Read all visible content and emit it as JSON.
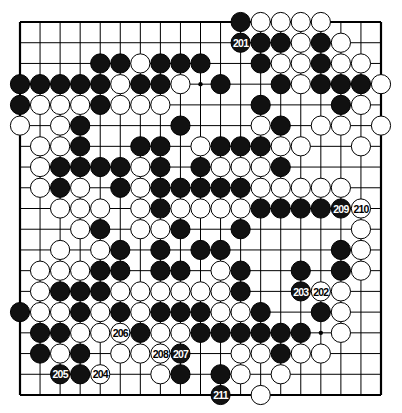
{
  "diagram": {
    "type": "go-board",
    "size": 19,
    "colors": {
      "black": "#111111",
      "white": "#ffffff",
      "line": "#000000"
    },
    "star_points": [
      [
        3,
        9
      ],
      [
        15,
        15
      ]
    ],
    "stones": [
      {
        "r": 0,
        "c": 11,
        "color": "B"
      },
      {
        "r": 0,
        "c": 12,
        "color": "W"
      },
      {
        "r": 0,
        "c": 13,
        "color": "W"
      },
      {
        "r": 0,
        "c": 14,
        "color": "W"
      },
      {
        "r": 0,
        "c": 15,
        "color": "W"
      },
      {
        "r": 1,
        "c": 11,
        "color": "B",
        "label": "201"
      },
      {
        "r": 1,
        "c": 12,
        "color": "B"
      },
      {
        "r": 1,
        "c": 13,
        "color": "B"
      },
      {
        "r": 1,
        "c": 14,
        "color": "W"
      },
      {
        "r": 1,
        "c": 15,
        "color": "B"
      },
      {
        "r": 1,
        "c": 16,
        "color": "W"
      },
      {
        "r": 2,
        "c": 4,
        "color": "B"
      },
      {
        "r": 2,
        "c": 5,
        "color": "B"
      },
      {
        "r": 2,
        "c": 6,
        "color": "W"
      },
      {
        "r": 2,
        "c": 7,
        "color": "B"
      },
      {
        "r": 2,
        "c": 8,
        "color": "B"
      },
      {
        "r": 2,
        "c": 9,
        "color": "B"
      },
      {
        "r": 2,
        "c": 12,
        "color": "B"
      },
      {
        "r": 2,
        "c": 13,
        "color": "W"
      },
      {
        "r": 2,
        "c": 14,
        "color": "W"
      },
      {
        "r": 2,
        "c": 15,
        "color": "B"
      },
      {
        "r": 2,
        "c": 16,
        "color": "W"
      },
      {
        "r": 2,
        "c": 17,
        "color": "W"
      },
      {
        "r": 3,
        "c": 0,
        "color": "B"
      },
      {
        "r": 3,
        "c": 1,
        "color": "B"
      },
      {
        "r": 3,
        "c": 2,
        "color": "B"
      },
      {
        "r": 3,
        "c": 3,
        "color": "B"
      },
      {
        "r": 3,
        "c": 4,
        "color": "B"
      },
      {
        "r": 3,
        "c": 5,
        "color": "W"
      },
      {
        "r": 3,
        "c": 6,
        "color": "B"
      },
      {
        "r": 3,
        "c": 7,
        "color": "B"
      },
      {
        "r": 3,
        "c": 8,
        "color": "W"
      },
      {
        "r": 3,
        "c": 10,
        "color": "B"
      },
      {
        "r": 3,
        "c": 13,
        "color": "B"
      },
      {
        "r": 3,
        "c": 14,
        "color": "W"
      },
      {
        "r": 3,
        "c": 15,
        "color": "B"
      },
      {
        "r": 3,
        "c": 16,
        "color": "B"
      },
      {
        "r": 3,
        "c": 17,
        "color": "B"
      },
      {
        "r": 3,
        "c": 18,
        "color": "W"
      },
      {
        "r": 4,
        "c": 0,
        "color": "B"
      },
      {
        "r": 4,
        "c": 1,
        "color": "W"
      },
      {
        "r": 4,
        "c": 2,
        "color": "W"
      },
      {
        "r": 4,
        "c": 3,
        "color": "W"
      },
      {
        "r": 4,
        "c": 4,
        "color": "B"
      },
      {
        "r": 4,
        "c": 5,
        "color": "W"
      },
      {
        "r": 4,
        "c": 6,
        "color": "W"
      },
      {
        "r": 4,
        "c": 7,
        "color": "W"
      },
      {
        "r": 4,
        "c": 12,
        "color": "B"
      },
      {
        "r": 4,
        "c": 16,
        "color": "B"
      },
      {
        "r": 4,
        "c": 17,
        "color": "W"
      },
      {
        "r": 5,
        "c": 0,
        "color": "W"
      },
      {
        "r": 5,
        "c": 2,
        "color": "W"
      },
      {
        "r": 5,
        "c": 3,
        "color": "B"
      },
      {
        "r": 5,
        "c": 8,
        "color": "B"
      },
      {
        "r": 5,
        "c": 12,
        "color": "W"
      },
      {
        "r": 5,
        "c": 13,
        "color": "B"
      },
      {
        "r": 5,
        "c": 15,
        "color": "W"
      },
      {
        "r": 5,
        "c": 16,
        "color": "W"
      },
      {
        "r": 5,
        "c": 18,
        "color": "W"
      },
      {
        "r": 6,
        "c": 1,
        "color": "W"
      },
      {
        "r": 6,
        "c": 2,
        "color": "W"
      },
      {
        "r": 6,
        "c": 3,
        "color": "B"
      },
      {
        "r": 6,
        "c": 6,
        "color": "B"
      },
      {
        "r": 6,
        "c": 7,
        "color": "B"
      },
      {
        "r": 6,
        "c": 9,
        "color": "W"
      },
      {
        "r": 6,
        "c": 10,
        "color": "B"
      },
      {
        "r": 6,
        "c": 11,
        "color": "B"
      },
      {
        "r": 6,
        "c": 12,
        "color": "B"
      },
      {
        "r": 6,
        "c": 13,
        "color": "W"
      },
      {
        "r": 6,
        "c": 14,
        "color": "W"
      },
      {
        "r": 6,
        "c": 17,
        "color": "W"
      },
      {
        "r": 7,
        "c": 1,
        "color": "W"
      },
      {
        "r": 7,
        "c": 2,
        "color": "B"
      },
      {
        "r": 7,
        "c": 3,
        "color": "B"
      },
      {
        "r": 7,
        "c": 4,
        "color": "B"
      },
      {
        "r": 7,
        "c": 5,
        "color": "B"
      },
      {
        "r": 7,
        "c": 6,
        "color": "W"
      },
      {
        "r": 7,
        "c": 7,
        "color": "B"
      },
      {
        "r": 7,
        "c": 9,
        "color": "B"
      },
      {
        "r": 7,
        "c": 10,
        "color": "W"
      },
      {
        "r": 7,
        "c": 11,
        "color": "W"
      },
      {
        "r": 7,
        "c": 12,
        "color": "W"
      },
      {
        "r": 7,
        "c": 13,
        "color": "B"
      },
      {
        "r": 8,
        "c": 1,
        "color": "W"
      },
      {
        "r": 8,
        "c": 2,
        "color": "B"
      },
      {
        "r": 8,
        "c": 3,
        "color": "W"
      },
      {
        "r": 8,
        "c": 5,
        "color": "B"
      },
      {
        "r": 8,
        "c": 6,
        "color": "W"
      },
      {
        "r": 8,
        "c": 7,
        "color": "B"
      },
      {
        "r": 8,
        "c": 8,
        "color": "B"
      },
      {
        "r": 8,
        "c": 9,
        "color": "B"
      },
      {
        "r": 8,
        "c": 10,
        "color": "B"
      },
      {
        "r": 8,
        "c": 11,
        "color": "B"
      },
      {
        "r": 8,
        "c": 12,
        "color": "W"
      },
      {
        "r": 8,
        "c": 13,
        "color": "W"
      },
      {
        "r": 8,
        "c": 14,
        "color": "W"
      },
      {
        "r": 8,
        "c": 15,
        "color": "W"
      },
      {
        "r": 8,
        "c": 16,
        "color": "W"
      },
      {
        "r": 9,
        "c": 2,
        "color": "W"
      },
      {
        "r": 9,
        "c": 3,
        "color": "W"
      },
      {
        "r": 9,
        "c": 4,
        "color": "W"
      },
      {
        "r": 9,
        "c": 6,
        "color": "W"
      },
      {
        "r": 9,
        "c": 7,
        "color": "B"
      },
      {
        "r": 9,
        "c": 8,
        "color": "W"
      },
      {
        "r": 9,
        "c": 9,
        "color": "W"
      },
      {
        "r": 9,
        "c": 10,
        "color": "W"
      },
      {
        "r": 9,
        "c": 11,
        "color": "W"
      },
      {
        "r": 9,
        "c": 12,
        "color": "B"
      },
      {
        "r": 9,
        "c": 13,
        "color": "B"
      },
      {
        "r": 9,
        "c": 14,
        "color": "B"
      },
      {
        "r": 9,
        "c": 15,
        "color": "B"
      },
      {
        "r": 9,
        "c": 16,
        "color": "B",
        "label": "209"
      },
      {
        "r": 9,
        "c": 17,
        "color": "W",
        "label": "210"
      },
      {
        "r": 10,
        "c": 3,
        "color": "W"
      },
      {
        "r": 10,
        "c": 4,
        "color": "B"
      },
      {
        "r": 10,
        "c": 6,
        "color": "W"
      },
      {
        "r": 10,
        "c": 7,
        "color": "W"
      },
      {
        "r": 10,
        "c": 8,
        "color": "B"
      },
      {
        "r": 10,
        "c": 11,
        "color": "B"
      },
      {
        "r": 10,
        "c": 17,
        "color": "W"
      },
      {
        "r": 11,
        "c": 2,
        "color": "W"
      },
      {
        "r": 11,
        "c": 4,
        "color": "W"
      },
      {
        "r": 11,
        "c": 5,
        "color": "B"
      },
      {
        "r": 11,
        "c": 7,
        "color": "B"
      },
      {
        "r": 11,
        "c": 9,
        "color": "B"
      },
      {
        "r": 11,
        "c": 10,
        "color": "B"
      },
      {
        "r": 11,
        "c": 16,
        "color": "B"
      },
      {
        "r": 11,
        "c": 17,
        "color": "W"
      },
      {
        "r": 12,
        "c": 1,
        "color": "W"
      },
      {
        "r": 12,
        "c": 2,
        "color": "W"
      },
      {
        "r": 12,
        "c": 3,
        "color": "W"
      },
      {
        "r": 12,
        "c": 4,
        "color": "B"
      },
      {
        "r": 12,
        "c": 5,
        "color": "B"
      },
      {
        "r": 12,
        "c": 7,
        "color": "B"
      },
      {
        "r": 12,
        "c": 8,
        "color": "B"
      },
      {
        "r": 12,
        "c": 10,
        "color": "W"
      },
      {
        "r": 12,
        "c": 11,
        "color": "B"
      },
      {
        "r": 12,
        "c": 14,
        "color": "B"
      },
      {
        "r": 12,
        "c": 16,
        "color": "B"
      },
      {
        "r": 12,
        "c": 17,
        "color": "W"
      },
      {
        "r": 13,
        "c": 1,
        "color": "W"
      },
      {
        "r": 13,
        "c": 2,
        "color": "B"
      },
      {
        "r": 13,
        "c": 3,
        "color": "B"
      },
      {
        "r": 13,
        "c": 4,
        "color": "B"
      },
      {
        "r": 13,
        "c": 5,
        "color": "W"
      },
      {
        "r": 13,
        "c": 6,
        "color": "W"
      },
      {
        "r": 13,
        "c": 7,
        "color": "W"
      },
      {
        "r": 13,
        "c": 8,
        "color": "W"
      },
      {
        "r": 13,
        "c": 9,
        "color": "W"
      },
      {
        "r": 13,
        "c": 10,
        "color": "W"
      },
      {
        "r": 13,
        "c": 11,
        "color": "B"
      },
      {
        "r": 13,
        "c": 14,
        "color": "B",
        "label": "203"
      },
      {
        "r": 13,
        "c": 15,
        "color": "W",
        "label": "202"
      },
      {
        "r": 13,
        "c": 16,
        "color": "W"
      },
      {
        "r": 14,
        "c": 0,
        "color": "B"
      },
      {
        "r": 14,
        "c": 1,
        "color": "W"
      },
      {
        "r": 14,
        "c": 2,
        "color": "W"
      },
      {
        "r": 14,
        "c": 3,
        "color": "B"
      },
      {
        "r": 14,
        "c": 4,
        "color": "W"
      },
      {
        "r": 14,
        "c": 5,
        "color": "B"
      },
      {
        "r": 14,
        "c": 6,
        "color": "W"
      },
      {
        "r": 14,
        "c": 7,
        "color": "B"
      },
      {
        "r": 14,
        "c": 8,
        "color": "B"
      },
      {
        "r": 14,
        "c": 9,
        "color": "B"
      },
      {
        "r": 14,
        "c": 10,
        "color": "W"
      },
      {
        "r": 14,
        "c": 11,
        "color": "W"
      },
      {
        "r": 14,
        "c": 12,
        "color": "B"
      },
      {
        "r": 14,
        "c": 15,
        "color": "B"
      },
      {
        "r": 14,
        "c": 16,
        "color": "W"
      },
      {
        "r": 15,
        "c": 1,
        "color": "B"
      },
      {
        "r": 15,
        "c": 2,
        "color": "B"
      },
      {
        "r": 15,
        "c": 3,
        "color": "W"
      },
      {
        "r": 15,
        "c": 4,
        "color": "W"
      },
      {
        "r": 15,
        "c": 5,
        "color": "W",
        "label": "206"
      },
      {
        "r": 15,
        "c": 6,
        "color": "B"
      },
      {
        "r": 15,
        "c": 7,
        "color": "W"
      },
      {
        "r": 15,
        "c": 8,
        "color": "W"
      },
      {
        "r": 15,
        "c": 9,
        "color": "B"
      },
      {
        "r": 15,
        "c": 10,
        "color": "B"
      },
      {
        "r": 15,
        "c": 11,
        "color": "B"
      },
      {
        "r": 15,
        "c": 12,
        "color": "B"
      },
      {
        "r": 15,
        "c": 13,
        "color": "B"
      },
      {
        "r": 15,
        "c": 14,
        "color": "B"
      },
      {
        "r": 15,
        "c": 16,
        "color": "W"
      },
      {
        "r": 16,
        "c": 1,
        "color": "B"
      },
      {
        "r": 16,
        "c": 2,
        "color": "W"
      },
      {
        "r": 16,
        "c": 3,
        "color": "B"
      },
      {
        "r": 16,
        "c": 5,
        "color": "W"
      },
      {
        "r": 16,
        "c": 6,
        "color": "W"
      },
      {
        "r": 16,
        "c": 7,
        "color": "W",
        "label": "208"
      },
      {
        "r": 16,
        "c": 8,
        "color": "B",
        "label": "207"
      },
      {
        "r": 16,
        "c": 11,
        "color": "W"
      },
      {
        "r": 16,
        "c": 12,
        "color": "W"
      },
      {
        "r": 16,
        "c": 13,
        "color": "B"
      },
      {
        "r": 16,
        "c": 14,
        "color": "W"
      },
      {
        "r": 16,
        "c": 15,
        "color": "W"
      },
      {
        "r": 17,
        "c": 2,
        "color": "B",
        "label": "205"
      },
      {
        "r": 17,
        "c": 3,
        "color": "B"
      },
      {
        "r": 17,
        "c": 4,
        "color": "W",
        "label": "204"
      },
      {
        "r": 17,
        "c": 7,
        "color": "W"
      },
      {
        "r": 17,
        "c": 8,
        "color": "B"
      },
      {
        "r": 17,
        "c": 10,
        "color": "B"
      },
      {
        "r": 17,
        "c": 11,
        "color": "W"
      },
      {
        "r": 17,
        "c": 13,
        "color": "W"
      },
      {
        "r": 18,
        "c": 10,
        "color": "B",
        "label": "211"
      },
      {
        "r": 18,
        "c": 12,
        "color": "W"
      }
    ]
  }
}
